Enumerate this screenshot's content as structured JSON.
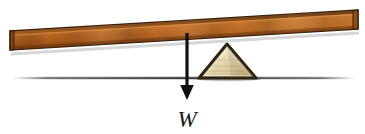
{
  "figure": {
    "name": "lever-seesaw-free-body-diagram",
    "background_color": "#ffffff",
    "width": 365,
    "height": 134
  },
  "plank": {
    "name": "wooden-plank",
    "material": "wood",
    "face_color": "#c4762f",
    "highlight_color": "#d98c42",
    "shadow_color": "#8a4a17",
    "edge_color": "#3a2209",
    "tilt": "left-end-low",
    "left_top_y": 31,
    "left_bottom_y": 50,
    "right_top_y": 10,
    "right_bottom_y": 29,
    "left_x": 10,
    "right_x": 358
  },
  "fulcrum": {
    "name": "triangular-fulcrum",
    "fill_color": "#e6dcb6",
    "highlight_color": "#f2ecd4",
    "shade_color": "#c9b984",
    "outline_color": "#2e2414",
    "apex_x": 227,
    "apex_y": 44,
    "base_left_x": 199,
    "base_right_x": 256,
    "base_y": 78
  },
  "ground": {
    "name": "ground-line",
    "color": "#4a4a4a",
    "y": 78,
    "start_x": 12,
    "end_x": 355
  },
  "force_arrow": {
    "name": "weight-force-arrow",
    "color": "#111111",
    "label": "W",
    "label_meaning": "weight",
    "x": 187,
    "start_y": 33,
    "tip_y": 99,
    "shaft_width": 3,
    "head_width": 15,
    "head_height": 13,
    "direction": "down"
  },
  "label": {
    "name": "weight-label",
    "text": "W",
    "x": 187,
    "y": 124,
    "color": "#1a1a1a",
    "style": "italic"
  }
}
